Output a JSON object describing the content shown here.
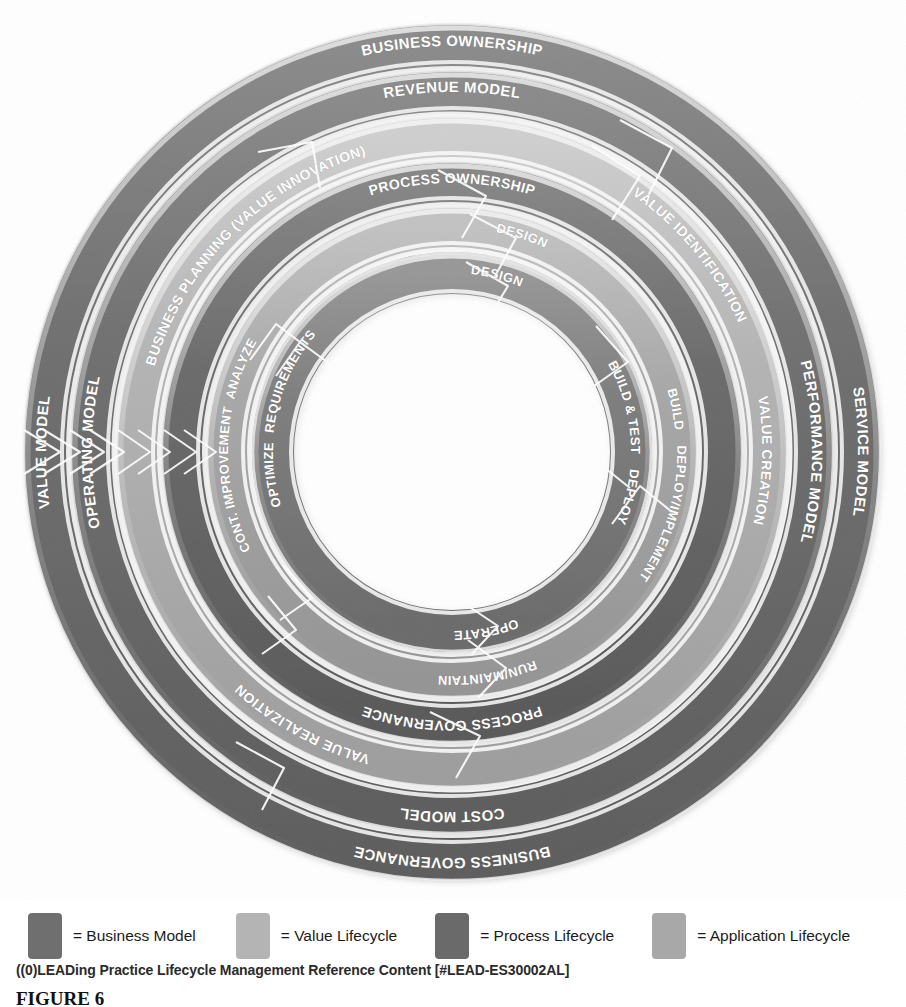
{
  "figure": {
    "caption": "FIGURE 6",
    "source_line": "((0)LEADing Practice Lifecycle Management Reference Content [#LEAD-ES30002AL]"
  },
  "colors": {
    "business_model": "#6f6f6f",
    "value_lifecycle": "#b4b4b4",
    "process_lifecycle": "#6a6a6a",
    "application_lifecycle": "#a8a8a8",
    "highlight": "#f2f2f2",
    "label_text": "#ffffff",
    "page_background": "#ffffff"
  },
  "legend": {
    "items": [
      {
        "label": "= Business Model",
        "color": "#6f6f6f",
        "swatch_name": "business-model-swatch"
      },
      {
        "label": "= Value Lifecycle",
        "color": "#b4b4b4",
        "swatch_name": "value-lifecycle-swatch"
      },
      {
        "label": "= Process Lifecycle",
        "color": "#6a6a6a",
        "swatch_name": "process-lifecycle-swatch"
      },
      {
        "label": "= Application Lifecycle",
        "color": "#a8a8a8",
        "swatch_name": "application-lifecycle-swatch"
      }
    ]
  },
  "diagram": {
    "type": "concentric-cyclic-rings",
    "center": {
      "x": 452,
      "y": 452
    },
    "inner_hole_radius": 114,
    "ring_count": 7,
    "rotation_direction": "clockwise",
    "rings": [
      {
        "index": 1,
        "category": "Business Model",
        "color": "#6f6f6f",
        "outer_radius": 428,
        "inner_radius": 386,
        "labels": [
          {
            "text": "BUSINESS OWNERSHIP",
            "position": "top",
            "font_size": 15
          },
          {
            "text": "SERVICE MODEL",
            "position": "right",
            "font_size": 15
          },
          {
            "text": "BUSINESS GOVERNANCE",
            "position": "bottom",
            "font_size": 15
          },
          {
            "text": "VALUE MODEL",
            "position": "left",
            "font_size": 15
          }
        ]
      },
      {
        "index": 2,
        "category": "Business Model",
        "color": "#6f6f6f",
        "outer_radius": 381,
        "inner_radius": 340,
        "labels": [
          {
            "text": "REVENUE MODEL",
            "position": "top",
            "font_size": 15
          },
          {
            "text": "PERFORMANCE MODEL",
            "position": "right",
            "font_size": 15
          },
          {
            "text": "COST MODEL",
            "position": "bottom",
            "font_size": 15
          },
          {
            "text": "OPERATING MODEL",
            "position": "left",
            "font_size": 15
          }
        ]
      },
      {
        "index": 3,
        "category": "Value Lifecycle",
        "color": "#b4b4b4",
        "outer_radius": 335,
        "inner_radius": 295,
        "labels": [
          {
            "text": "BUSINESS PLANNING (VALUE INNOVATION)",
            "position": "top-left",
            "font_size": 14
          },
          {
            "text": "VALUE IDENTIFICATION",
            "position": "right",
            "font_size": 14
          },
          {
            "text": "VALUE CREATION",
            "position": "bottom-right",
            "font_size": 14
          },
          {
            "text": "VALUE REALIZATION",
            "position": "bottom-left",
            "font_size": 14
          }
        ]
      },
      {
        "index": 4,
        "category": "Process Lifecycle",
        "color": "#6a6a6a",
        "outer_radius": 290,
        "inner_radius": 250,
        "labels": [
          {
            "text": "PROCESS OWNERSHIP",
            "position": "top",
            "font_size": 14
          },
          {
            "text": "PROCESS GOVERNANCE",
            "position": "bottom",
            "font_size": 14
          }
        ]
      },
      {
        "index": 5,
        "category": "Application Lifecycle",
        "color": "#a8a8a8",
        "outer_radius": 245,
        "inner_radius": 205,
        "labels": [
          {
            "text": "ANALYZE",
            "position": "top-left",
            "font_size": 13
          },
          {
            "text": "DESIGN",
            "position": "top-right",
            "font_size": 13
          },
          {
            "text": "BUILD",
            "position": "right",
            "font_size": 13
          },
          {
            "text": "DEPLOY/IMPLEMENT",
            "position": "bottom-right",
            "font_size": 13
          },
          {
            "text": "RUN/MAINTAIN",
            "position": "bottom-left",
            "font_size": 13
          },
          {
            "text": "CONT. IMPROVEMENT",
            "position": "left",
            "font_size": 13
          }
        ]
      },
      {
        "index": 6,
        "category": "Application Lifecycle",
        "color": "#7d7d7d",
        "outer_radius": 200,
        "inner_radius": 158,
        "labels": [
          {
            "text": "REQUIREMENTS",
            "position": "top-left",
            "font_size": 13
          },
          {
            "text": "DESIGN",
            "position": "top-right",
            "font_size": 13
          },
          {
            "text": "BUILD & TEST",
            "position": "right",
            "font_size": 13
          },
          {
            "text": "DEPLOY",
            "position": "bottom-right",
            "font_size": 13
          },
          {
            "text": "OPERATE",
            "position": "bottom-left",
            "font_size": 13
          },
          {
            "text": "OPTIMIZE",
            "position": "left",
            "font_size": 13
          }
        ]
      }
    ]
  }
}
